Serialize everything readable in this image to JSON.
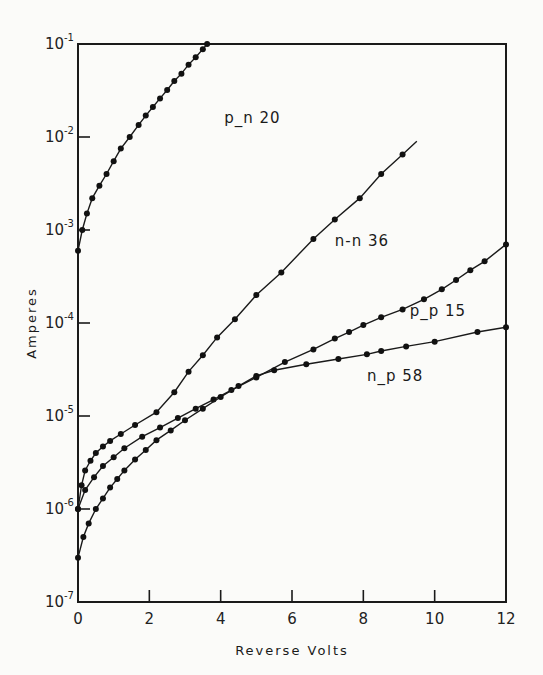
{
  "chart_data": {
    "type": "line",
    "title": "",
    "xlabel": "Reverse Volts",
    "ylabel": "Amperes",
    "xlim": [
      0,
      12
    ],
    "ylim": [
      1e-07,
      0.1
    ],
    "yscale": "log",
    "grid": false,
    "legend": "inline labels",
    "x_ticks": [
      "0",
      "2",
      "4",
      "6",
      "8",
      "10",
      "12"
    ],
    "y_ticks": [
      {
        "base": "10",
        "exp": "-1"
      },
      {
        "base": "10",
        "exp": "-2"
      },
      {
        "base": "10",
        "exp": "-3"
      },
      {
        "base": "10",
        "exp": "-4"
      },
      {
        "base": "10",
        "exp": "-5"
      },
      {
        "base": "10",
        "exp": "-6"
      },
      {
        "base": "10",
        "exp": "-7"
      }
    ],
    "series": [
      {
        "name": "p_n 20",
        "label_pos": [
          4.1,
          0.014
        ],
        "x": [
          0,
          0.12,
          0.25,
          0.4,
          0.6,
          0.8,
          1.0,
          1.2,
          1.45,
          1.7,
          1.9,
          2.1,
          2.3,
          2.5,
          2.7,
          2.9,
          3.1,
          3.3,
          3.5,
          3.62
        ],
        "values": [
          0.0006,
          0.001,
          0.0015,
          0.0022,
          0.003,
          0.004,
          0.0055,
          0.0075,
          0.01,
          0.0135,
          0.017,
          0.021,
          0.026,
          0.032,
          0.04,
          0.048,
          0.06,
          0.072,
          0.088,
          0.1
        ]
      },
      {
        "name": "n-n 36",
        "label_pos": [
          7.2,
          0.00068
        ],
        "x": [
          0,
          0.1,
          0.2,
          0.35,
          0.5,
          0.7,
          0.9,
          1.2,
          1.6,
          2.2,
          2.7,
          3.1,
          3.5,
          3.9,
          4.4,
          5.0,
          5.7,
          6.6,
          7.2,
          7.9,
          8.5,
          9.1,
          9.5
        ],
        "values": [
          1e-06,
          1.8e-06,
          2.6e-06,
          3.3e-06,
          4e-06,
          4.7e-06,
          5.4e-06,
          6.4e-06,
          8e-06,
          1.1e-05,
          1.8e-05,
          3e-05,
          4.5e-05,
          7e-05,
          0.00011,
          0.0002,
          0.00035,
          0.0008,
          0.0013,
          0.0022,
          0.004,
          0.0065,
          0.009
        ]
      },
      {
        "name": "p_p 15",
        "label_pos": [
          9.3,
          0.00012
        ],
        "x": [
          0,
          0.2,
          0.45,
          0.7,
          1.0,
          1.3,
          1.8,
          2.3,
          2.8,
          3.3,
          3.8,
          4.3,
          5.0,
          5.8,
          6.6,
          7.2,
          7.6,
          8.0,
          8.5,
          9.1,
          9.7,
          10.2,
          10.6,
          11.0,
          11.4,
          12.0
        ],
        "values": [
          1e-06,
          1.6e-06,
          2.2e-06,
          2.9e-06,
          3.6e-06,
          4.5e-06,
          6e-06,
          7.5e-06,
          9.5e-06,
          1.2e-05,
          1.5e-05,
          1.9e-05,
          2.6e-05,
          3.8e-05,
          5.2e-05,
          6.8e-05,
          8e-05,
          9.5e-05,
          0.000115,
          0.00014,
          0.00018,
          0.00023,
          0.00029,
          0.00037,
          0.00046,
          0.0007
        ]
      },
      {
        "name": "n_p 58",
        "label_pos": [
          8.1,
          2.4e-05
        ],
        "x": [
          0,
          0.15,
          0.3,
          0.5,
          0.7,
          0.9,
          1.1,
          1.3,
          1.6,
          1.9,
          2.2,
          2.6,
          3.0,
          3.5,
          4.0,
          4.5,
          5.0,
          5.5,
          6.4,
          7.3,
          8.1,
          8.5,
          9.2,
          10.0,
          11.2,
          12.0
        ],
        "values": [
          3e-07,
          5e-07,
          7e-07,
          1e-06,
          1.3e-06,
          1.7e-06,
          2.1e-06,
          2.6e-06,
          3.4e-06,
          4.3e-06,
          5.5e-06,
          7e-06,
          9e-06,
          1.2e-05,
          1.6e-05,
          2.1e-05,
          2.7e-05,
          3.1e-05,
          3.6e-05,
          4.1e-05,
          4.6e-05,
          5e-05,
          5.6e-05,
          6.3e-05,
          8e-05,
          9e-05
        ]
      }
    ]
  }
}
